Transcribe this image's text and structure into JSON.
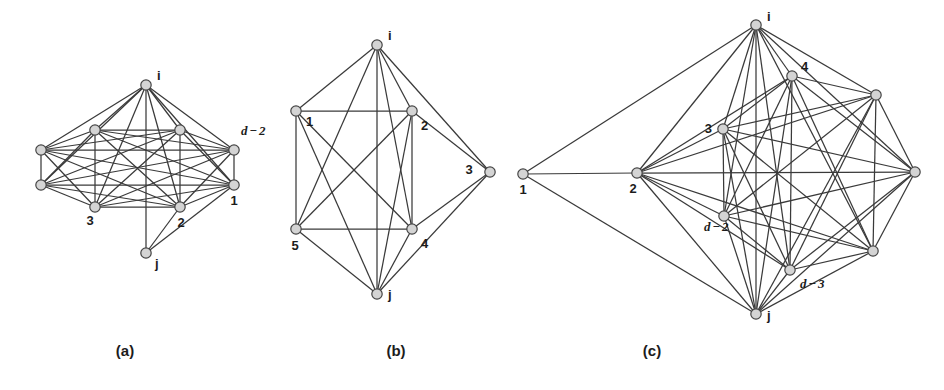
{
  "figure": {
    "width": 944,
    "height": 390,
    "background": "#ffffff",
    "edge_color": "#3a3a3a",
    "node_fill": "#d4d4d4",
    "node_stroke": "#454545",
    "text_color": "#1c1c1c"
  },
  "panels": [
    {
      "id": "a",
      "caption": "(a)",
      "caption_pos": {
        "x": 125,
        "y": 356
      },
      "nodes": [
        {
          "id": "i",
          "label": "i",
          "style": "plain",
          "x": 146,
          "y": 85,
          "lx": 157,
          "ly": 80,
          "anchor": "start"
        },
        {
          "id": "r1",
          "label": "",
          "style": "plain",
          "x": 95,
          "y": 130,
          "lx": 0,
          "ly": 0,
          "anchor": "start"
        },
        {
          "id": "r2",
          "label": "",
          "style": "plain",
          "x": 41,
          "y": 150,
          "lx": 0,
          "ly": 0,
          "anchor": "start"
        },
        {
          "id": "r3",
          "label": "",
          "style": "plain",
          "x": 41,
          "y": 185,
          "lx": 0,
          "ly": 0,
          "anchor": "start"
        },
        {
          "id": "r4",
          "label": "3",
          "style": "plain",
          "x": 95,
          "y": 207,
          "lx": 90,
          "ly": 225,
          "anchor": "middle"
        },
        {
          "id": "r5",
          "label": "2",
          "style": "plain",
          "x": 180,
          "y": 207,
          "lx": 181,
          "ly": 227,
          "anchor": "middle"
        },
        {
          "id": "r6",
          "label": "1",
          "style": "plain",
          "x": 234,
          "y": 185,
          "lx": 234,
          "ly": 205,
          "anchor": "middle"
        },
        {
          "id": "r7",
          "label": "d - 2",
          "style": "math",
          "x": 234,
          "y": 150,
          "lx": 241,
          "ly": 135,
          "anchor": "start"
        },
        {
          "id": "r8",
          "label": "",
          "style": "plain",
          "x": 180,
          "y": 130,
          "lx": 0,
          "ly": 0,
          "anchor": "start"
        },
        {
          "id": "j",
          "label": "j",
          "style": "plain",
          "x": 146,
          "y": 253,
          "lx": 155,
          "ly": 268,
          "anchor": "start"
        }
      ],
      "edges": [
        [
          "i",
          "r1"
        ],
        [
          "i",
          "r2"
        ],
        [
          "i",
          "r3"
        ],
        [
          "i",
          "r4"
        ],
        [
          "i",
          "r5"
        ],
        [
          "i",
          "r6"
        ],
        [
          "i",
          "r7"
        ],
        [
          "i",
          "r8"
        ],
        [
          "r1",
          "r2"
        ],
        [
          "r1",
          "r3"
        ],
        [
          "r1",
          "r4"
        ],
        [
          "r1",
          "r5"
        ],
        [
          "r1",
          "r6"
        ],
        [
          "r1",
          "r7"
        ],
        [
          "r1",
          "r8"
        ],
        [
          "r2",
          "r3"
        ],
        [
          "r2",
          "r4"
        ],
        [
          "r2",
          "r5"
        ],
        [
          "r2",
          "r6"
        ],
        [
          "r2",
          "r7"
        ],
        [
          "r2",
          "r8"
        ],
        [
          "r3",
          "r4"
        ],
        [
          "r3",
          "r5"
        ],
        [
          "r3",
          "r6"
        ],
        [
          "r3",
          "r7"
        ],
        [
          "r3",
          "r8"
        ],
        [
          "r4",
          "r5"
        ],
        [
          "r4",
          "r6"
        ],
        [
          "r4",
          "r7"
        ],
        [
          "r4",
          "r8"
        ],
        [
          "r5",
          "r6"
        ],
        [
          "r5",
          "r7"
        ],
        [
          "r5",
          "r8"
        ],
        [
          "r6",
          "r7"
        ],
        [
          "r6",
          "r8"
        ],
        [
          "r7",
          "r8"
        ],
        [
          "j",
          "i"
        ],
        [
          "j",
          "r5"
        ],
        [
          "j",
          "r6"
        ]
      ]
    },
    {
      "id": "b",
      "caption": "(b)",
      "caption_pos": {
        "x": 396,
        "y": 356
      },
      "nodes": [
        {
          "id": "i",
          "label": "i",
          "style": "plain",
          "x": 377,
          "y": 45,
          "lx": 388,
          "ly": 40,
          "anchor": "start"
        },
        {
          "id": "n1",
          "label": "1",
          "style": "plain",
          "x": 296,
          "y": 111,
          "lx": 306,
          "ly": 126,
          "anchor": "start"
        },
        {
          "id": "n2",
          "label": "2",
          "style": "plain",
          "x": 412,
          "y": 111,
          "lx": 421,
          "ly": 130,
          "anchor": "start"
        },
        {
          "id": "n3",
          "label": "3",
          "style": "plain",
          "x": 490,
          "y": 172,
          "lx": 469,
          "ly": 174,
          "anchor": "middle"
        },
        {
          "id": "n4",
          "label": "4",
          "style": "plain",
          "x": 412,
          "y": 229,
          "lx": 421,
          "ly": 248,
          "anchor": "start"
        },
        {
          "id": "n5",
          "label": "5",
          "style": "plain",
          "x": 296,
          "y": 229,
          "lx": 295,
          "ly": 250,
          "anchor": "middle"
        },
        {
          "id": "j",
          "label": "j",
          "style": "plain",
          "x": 377,
          "y": 294,
          "lx": 388,
          "ly": 299,
          "anchor": "start"
        }
      ],
      "edges": [
        [
          "i",
          "n1"
        ],
        [
          "i",
          "n2"
        ],
        [
          "i",
          "n3"
        ],
        [
          "i",
          "n4"
        ],
        [
          "i",
          "n5"
        ],
        [
          "i",
          "j"
        ],
        [
          "n1",
          "n2"
        ],
        [
          "n1",
          "n4"
        ],
        [
          "n1",
          "n5"
        ],
        [
          "n1",
          "j"
        ],
        [
          "n2",
          "n3"
        ],
        [
          "n2",
          "n4"
        ],
        [
          "n2",
          "n5"
        ],
        [
          "n2",
          "j"
        ],
        [
          "n3",
          "n4"
        ],
        [
          "n3",
          "j"
        ],
        [
          "n4",
          "n5"
        ],
        [
          "n4",
          "j"
        ],
        [
          "n5",
          "j"
        ]
      ]
    },
    {
      "id": "c",
      "caption": "(c)",
      "caption_pos": {
        "x": 652,
        "y": 356
      },
      "nodes": [
        {
          "id": "i",
          "label": "i",
          "style": "plain",
          "x": 756,
          "y": 25,
          "lx": 767,
          "ly": 21,
          "anchor": "start"
        },
        {
          "id": "n1",
          "label": "1",
          "style": "plain",
          "x": 523,
          "y": 174,
          "lx": 523,
          "ly": 194,
          "anchor": "middle"
        },
        {
          "id": "n2",
          "label": "2",
          "style": "plain",
          "x": 637,
          "y": 173,
          "lx": 633,
          "ly": 193,
          "anchor": "middle"
        },
        {
          "id": "n3",
          "label": "3",
          "style": "plain",
          "x": 723,
          "y": 129,
          "lx": 712,
          "ly": 133,
          "anchor": "end"
        },
        {
          "id": "n4",
          "label": "4",
          "style": "plain",
          "x": 792,
          "y": 76,
          "lx": 801,
          "ly": 71,
          "anchor": "start"
        },
        {
          "id": "n5",
          "label": "",
          "style": "plain",
          "x": 876,
          "y": 95,
          "lx": 0,
          "ly": 0,
          "anchor": "start"
        },
        {
          "id": "n6",
          "label": "",
          "style": "plain",
          "x": 915,
          "y": 172,
          "lx": 0,
          "ly": 0,
          "anchor": "start"
        },
        {
          "id": "n7",
          "label": "",
          "style": "plain",
          "x": 873,
          "y": 251,
          "lx": 0,
          "ly": 0,
          "anchor": "start"
        },
        {
          "id": "n8",
          "label": "d - 3",
          "style": "math",
          "x": 790,
          "y": 270,
          "lx": 800,
          "ly": 288,
          "anchor": "start"
        },
        {
          "id": "n9",
          "label": "d - 2",
          "style": "math",
          "x": 724,
          "y": 216,
          "lx": 704,
          "ly": 231,
          "anchor": "start"
        },
        {
          "id": "j",
          "label": "j",
          "style": "plain",
          "x": 756,
          "y": 314,
          "lx": 767,
          "ly": 320,
          "anchor": "start"
        }
      ],
      "edges": [
        [
          "n1",
          "i"
        ],
        [
          "n1",
          "n2"
        ],
        [
          "n1",
          "j"
        ],
        [
          "i",
          "n2"
        ],
        [
          "i",
          "n3"
        ],
        [
          "i",
          "n4"
        ],
        [
          "i",
          "n5"
        ],
        [
          "i",
          "n6"
        ],
        [
          "i",
          "n7"
        ],
        [
          "i",
          "n8"
        ],
        [
          "i",
          "n9"
        ],
        [
          "i",
          "j"
        ],
        [
          "n2",
          "n3"
        ],
        [
          "n2",
          "n4"
        ],
        [
          "n2",
          "n5"
        ],
        [
          "n2",
          "n6"
        ],
        [
          "n2",
          "n7"
        ],
        [
          "n2",
          "n8"
        ],
        [
          "n2",
          "n9"
        ],
        [
          "n2",
          "j"
        ],
        [
          "n3",
          "n4"
        ],
        [
          "n3",
          "n5"
        ],
        [
          "n3",
          "n6"
        ],
        [
          "n3",
          "n7"
        ],
        [
          "n3",
          "n8"
        ],
        [
          "n3",
          "n9"
        ],
        [
          "n3",
          "j"
        ],
        [
          "n4",
          "n5"
        ],
        [
          "n4",
          "n6"
        ],
        [
          "n4",
          "n7"
        ],
        [
          "n4",
          "n8"
        ],
        [
          "n4",
          "n9"
        ],
        [
          "n4",
          "j"
        ],
        [
          "n5",
          "n6"
        ],
        [
          "n5",
          "n7"
        ],
        [
          "n5",
          "n8"
        ],
        [
          "n5",
          "n9"
        ],
        [
          "n5",
          "j"
        ],
        [
          "n6",
          "n7"
        ],
        [
          "n6",
          "n8"
        ],
        [
          "n6",
          "n9"
        ],
        [
          "n6",
          "j"
        ],
        [
          "n7",
          "n8"
        ],
        [
          "n7",
          "n9"
        ],
        [
          "n7",
          "j"
        ],
        [
          "n8",
          "n9"
        ],
        [
          "n8",
          "j"
        ],
        [
          "n9",
          "j"
        ]
      ]
    }
  ]
}
